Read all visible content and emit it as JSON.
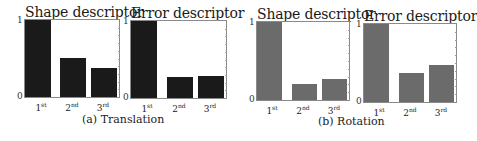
{
  "chart_data": [
    {
      "type": "bar",
      "group": "(a) Translation",
      "title": "Shape descriptor",
      "categories": [
        "1st",
        "2nd",
        "3rd"
      ],
      "values": [
        1.0,
        0.51,
        0.38
      ],
      "ylim": [
        0,
        1
      ],
      "yticks": [
        "0",
        "1"
      ],
      "bar_color": "#1a1a1a"
    },
    {
      "type": "bar",
      "group": "(a) Translation",
      "title": "Error descriptor",
      "categories": [
        "1st",
        "2nd",
        "3rd"
      ],
      "values": [
        1.0,
        0.27,
        0.28
      ],
      "ylim": [
        0,
        1
      ],
      "yticks": [
        "0",
        "1"
      ],
      "bar_color": "#1a1a1a"
    },
    {
      "type": "bar",
      "group": "(b) Rotation",
      "title": "Shape descriptor",
      "categories": [
        "1st",
        "2nd",
        "3rd"
      ],
      "values": [
        1.0,
        0.2,
        0.27
      ],
      "ylim": [
        0,
        1
      ],
      "yticks": [
        "0",
        "1"
      ],
      "bar_color": "#6b6b6b"
    },
    {
      "type": "bar",
      "group": "(b) Rotation",
      "title": "Error descriptor",
      "categories": [
        "1st",
        "2nd",
        "3rd"
      ],
      "values": [
        1.0,
        0.37,
        0.47
      ],
      "ylim": [
        0,
        1
      ],
      "yticks": [
        "0",
        "1"
      ],
      "bar_color": "#6b6b6b"
    }
  ],
  "captions": {
    "a": "(a) Translation",
    "b": "(b) Rotation"
  },
  "tick_labels": {
    "one": "1",
    "zero": "0"
  },
  "x_labels": [
    {
      "base": "1",
      "sup": "st"
    },
    {
      "base": "2",
      "sup": "nd"
    },
    {
      "base": "3",
      "sup": "rd"
    }
  ]
}
